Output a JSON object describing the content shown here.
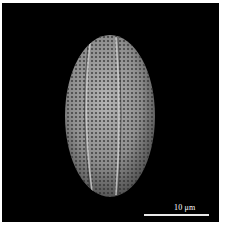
{
  "image": {
    "description": "SEM micrograph of an elliptical, reticulate pollen grain with longitudinal colpi on black background",
    "background_color": "#000000",
    "subject_color": "#9a9a9a"
  },
  "scale_bar": {
    "label": "10 μm"
  }
}
